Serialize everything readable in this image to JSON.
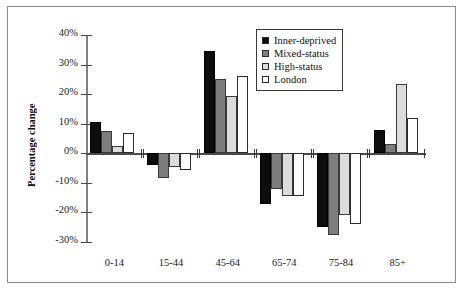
{
  "chart_data": {
    "type": "bar",
    "title": "",
    "subtitle": "",
    "xlabel": "",
    "ylabel": "Percentage change",
    "categories": [
      "0-14",
      "15-44",
      "45-64",
      "65-74",
      "75-84",
      "85+"
    ],
    "series": [
      {
        "name": "Inner-deprived",
        "color": "#0d0d0d",
        "values": [
          10.5,
          -4,
          34.5,
          -17,
          -25,
          8
        ]
      },
      {
        "name": "Mixed-status",
        "color": "#7d7d7d",
        "values": [
          7.5,
          -8.5,
          25,
          -12,
          -27.5,
          3
        ]
      },
      {
        "name": "High-status",
        "color": "#dcdcdc",
        "values": [
          2.5,
          -4.5,
          19.5,
          -14.5,
          -21,
          23.5
        ]
      },
      {
        "name": "London",
        "color": "#ffffff",
        "values": [
          7,
          -5.5,
          26,
          -14.5,
          -24,
          12
        ]
      }
    ],
    "ylim": [
      -30,
      40
    ],
    "ytick_labels": [
      "40%",
      "30%",
      "20%",
      "10%",
      "0%",
      "-10%",
      "-20%",
      "-30%"
    ],
    "ytick_values": [
      40,
      30,
      20,
      10,
      0,
      -10,
      -20,
      -30
    ],
    "grid": false,
    "legend_position": "top-right",
    "zero_line": true
  },
  "legend": {
    "items": [
      {
        "label": "Inner-deprived",
        "swatch": "#0d0d0d"
      },
      {
        "label": "Mixed-status",
        "swatch": "#7d7d7d"
      },
      {
        "label": "High-status",
        "swatch": "#dcdcdc"
      },
      {
        "label": "London",
        "swatch": "#ffffff"
      }
    ]
  }
}
